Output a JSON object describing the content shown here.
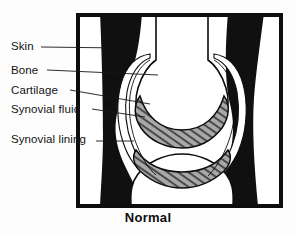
{
  "figure": {
    "title_caption": "Normal",
    "style": "black-and-white scanned line illustration",
    "colors": {
      "ink": "#0d0d0d",
      "soft_tissue_fill": "#101010",
      "bone_fill": "#ffffff",
      "cartilage_fill": "#9a9a9a",
      "page_background": "#fdfdfd"
    },
    "labels": [
      {
        "id": "skin",
        "text": "Skin",
        "points_to": "outer dark soft-tissue margin"
      },
      {
        "id": "bone",
        "text": "Bone",
        "points_to": "white femoral bone end"
      },
      {
        "id": "cartilage",
        "text": "Cartilage",
        "points_to": "stippled band on joint surface"
      },
      {
        "id": "synovial_fluid",
        "text": "Synovial fluid",
        "points_to": "clear space inside joint capsule"
      },
      {
        "id": "synovial_lining",
        "text": "Synovial lining",
        "points_to": "thin line bounding the capsule"
      }
    ]
  }
}
